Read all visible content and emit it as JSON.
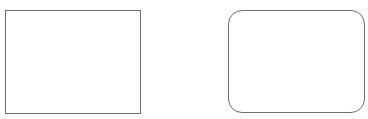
{
  "diagram": {
    "shapes": [
      {
        "type": "rectangle",
        "label": "",
        "stroke": "#6e6e6e",
        "fill": "#ffffff"
      },
      {
        "type": "rounded-rectangle",
        "label": "",
        "stroke": "#6e6e6e",
        "fill": "#ffffff"
      }
    ]
  }
}
